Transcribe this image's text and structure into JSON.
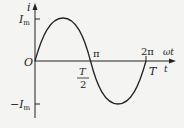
{
  "diagram": {
    "type": "sine-wave-ac-current",
    "axes": {
      "y_label": "i",
      "x_label_top": "ωt",
      "x_label_bottom": "t",
      "origin": "O"
    },
    "y_ticks": {
      "max": "I",
      "max_sub": "m",
      "min_prefix": "−",
      "min": "I",
      "min_sub": "m"
    },
    "x_ticks": {
      "pi": "π",
      "two_pi": "2π",
      "half_period_num": "T",
      "half_period_den": "2",
      "period": "T"
    },
    "colors": {
      "background": "#f4f4f2",
      "line": "#222222"
    }
  }
}
